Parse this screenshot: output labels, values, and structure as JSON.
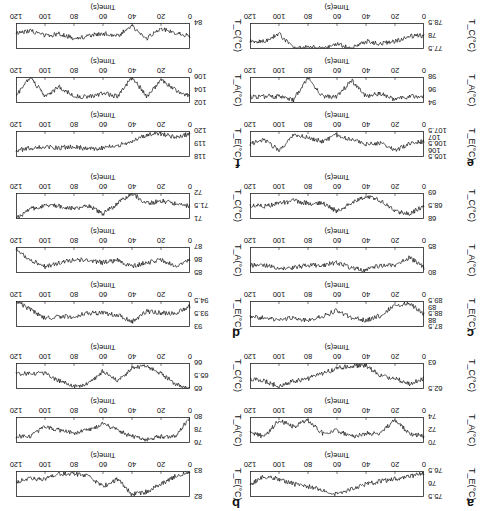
{
  "figure": {
    "rotation_deg": 180,
    "x_axis": {
      "label": "Time(s)",
      "ticks": [
        "0",
        "20",
        "40",
        "60",
        "80",
        "100",
        "120"
      ],
      "range": [
        0,
        120
      ]
    },
    "panels": [
      {
        "label": "a",
        "TE": {
          "ylabel": "T_E(°C)",
          "ticks": [
            "75.5",
            "76",
            "76.5"
          ],
          "range": [
            75.5,
            76.5
          ]
        },
        "TA": {
          "ylabel": "T_A(°C)",
          "ticks": [
            "70",
            "72",
            "74"
          ],
          "range": [
            70,
            74
          ]
        },
        "TC": {
          "ylabel": "T_C(°C)",
          "ticks": [
            "62.5",
            "63"
          ],
          "range": [
            62.5,
            63
          ]
        }
      },
      {
        "label": "b",
        "TE": {
          "ylabel": "T_E(°C)",
          "ticks": [
            "82",
            "83"
          ],
          "range": [
            82,
            83
          ]
        },
        "TA": {
          "ylabel": "T_A(°C)",
          "ticks": [
            "76",
            "78",
            "80"
          ],
          "range": [
            76,
            80
          ]
        },
        "TC": {
          "ylabel": "T_C(°C)",
          "ticks": [
            "65",
            "65.5",
            "66"
          ],
          "range": [
            65,
            66
          ]
        }
      },
      {
        "label": "c",
        "TE": {
          "ylabel": "T_E(°C)",
          "ticks": [
            "87.5",
            "88",
            "88.5",
            "89",
            "89.5"
          ],
          "range": [
            87.5,
            89.5
          ]
        },
        "TA": {
          "ylabel": "T_A(°C)",
          "ticks": [
            "80",
            "85"
          ],
          "range": [
            80,
            85
          ]
        },
        "TC": {
          "ylabel": "T_C(°C)",
          "ticks": [
            "68",
            "68.5",
            "69"
          ],
          "range": [
            68,
            69
          ]
        }
      },
      {
        "label": "d",
        "TE": {
          "ylabel": "T_E(°C)",
          "ticks": [
            "93",
            "93.5",
            "94.5"
          ],
          "range": [
            93,
            94.5
          ]
        },
        "TA": {
          "ylabel": "T_A(°C)",
          "ticks": [
            "85",
            "86",
            "87"
          ],
          "range": [
            85,
            87
          ]
        },
        "TC": {
          "ylabel": "T_C(°C)",
          "ticks": [
            "71",
            "71.5",
            "72"
          ],
          "range": [
            71,
            72
          ]
        }
      },
      {
        "label": "e",
        "TE": {
          "ylabel": "T_E(°C)",
          "ticks": [
            "105.5",
            "106",
            "106.5",
            "107",
            "107.5"
          ],
          "range": [
            105.5,
            107.5
          ]
        },
        "TA": {
          "ylabel": "T_A(°C)",
          "ticks": [
            "94",
            "96",
            "98"
          ],
          "range": [
            94,
            98
          ]
        },
        "TC": {
          "ylabel": "T_C(°C)",
          "ticks": [
            "77.5",
            "78",
            "78.5"
          ],
          "range": [
            77.5,
            78.5
          ]
        }
      },
      {
        "label": "f",
        "TE": {
          "ylabel": "T_E(°C)",
          "ticks": [
            "118",
            "119",
            "120"
          ],
          "range": [
            118,
            120
          ]
        },
        "TA": {
          "ylabel": "T_A(°C)",
          "ticks": [
            "102",
            "104",
            "106"
          ],
          "range": [
            102,
            106
          ]
        },
        "TC": {
          "ylabel": "T_C(°C)",
          "ticks": [
            "84"
          ],
          "range": [
            84,
            85
          ]
        }
      }
    ]
  },
  "chart_data": [
    {
      "type": "line",
      "panel": "a",
      "series": "T_E",
      "xlabel": "Time(s)",
      "ylabel": "T_E(°C)",
      "xlim": [
        0,
        120
      ],
      "ylim": [
        75.5,
        76.5
      ],
      "x": [
        0,
        10,
        20,
        30,
        40,
        50,
        60,
        70,
        80,
        90,
        100,
        110,
        120
      ],
      "values": [
        76.4,
        76.3,
        76.2,
        76.1,
        76.0,
        75.8,
        75.6,
        75.8,
        75.9,
        76.0,
        76.2,
        76.3,
        76.0
      ]
    },
    {
      "type": "line",
      "panel": "a",
      "series": "T_A",
      "xlabel": "Time(s)",
      "ylabel": "T_A(°C)",
      "xlim": [
        0,
        120
      ],
      "ylim": [
        70,
        74
      ],
      "x": [
        0,
        10,
        20,
        30,
        40,
        50,
        60,
        70,
        80,
        90,
        100,
        110,
        120
      ],
      "values": [
        71,
        71.5,
        73.5,
        71.5,
        71.5,
        71,
        72,
        71.5,
        73.5,
        72.5,
        73.5,
        71,
        71.5
      ]
    },
    {
      "type": "line",
      "panel": "a",
      "series": "T_C",
      "xlabel": "Time(s)",
      "ylabel": "T_C(°C)",
      "xlim": [
        0,
        120
      ],
      "ylim": [
        62.5,
        63
      ],
      "x": [
        0,
        10,
        20,
        30,
        40,
        50,
        60,
        70,
        80,
        90,
        100,
        110,
        120
      ],
      "values": [
        62.7,
        62.6,
        62.7,
        62.75,
        62.95,
        62.95,
        62.9,
        62.8,
        62.7,
        62.65,
        62.55,
        62.65,
        62.7
      ]
    },
    {
      "type": "line",
      "panel": "b",
      "series": "T_E",
      "xlabel": "Time(s)",
      "ylabel": "T_E(°C)",
      "xlim": [
        0,
        120
      ],
      "ylim": [
        82,
        83
      ],
      "x": [
        0,
        10,
        20,
        30,
        40,
        50,
        60,
        70,
        80,
        90,
        100,
        110,
        120
      ],
      "values": [
        83,
        82.8,
        82.5,
        82.2,
        82.1,
        82.7,
        82.4,
        82.8,
        82.9,
        82.9,
        82.7,
        82.7,
        82.6
      ]
    },
    {
      "type": "line",
      "panel": "b",
      "series": "T_A",
      "xlabel": "Time(s)",
      "ylabel": "T_A(°C)",
      "xlim": [
        0,
        120
      ],
      "ylim": [
        76,
        80
      ],
      "x": [
        0,
        10,
        20,
        30,
        40,
        50,
        60,
        70,
        80,
        90,
        100,
        110,
        120
      ],
      "values": [
        80,
        77,
        77,
        76.5,
        77,
        78,
        79,
        78,
        77.5,
        78,
        78.5,
        77,
        77
      ]
    },
    {
      "type": "line",
      "panel": "b",
      "series": "T_C",
      "xlabel": "Time(s)",
      "ylabel": "T_C(°C)",
      "xlim": [
        0,
        120
      ],
      "ylim": [
        65,
        66
      ],
      "x": [
        0,
        10,
        20,
        30,
        40,
        50,
        60,
        70,
        80,
        90,
        100,
        110,
        120
      ],
      "values": [
        65,
        65.2,
        65.6,
        65.9,
        65.8,
        65.3,
        65.7,
        65.2,
        65.1,
        65.3,
        65.6,
        65.6,
        65.6
      ]
    },
    {
      "type": "line",
      "panel": "c",
      "series": "T_E",
      "xlabel": "Time(s)",
      "ylabel": "T_E(°C)",
      "xlim": [
        0,
        120
      ],
      "ylim": [
        87.5,
        89.5
      ],
      "x": [
        0,
        10,
        20,
        30,
        40,
        50,
        60,
        70,
        80,
        90,
        100,
        110,
        120
      ],
      "values": [
        88.5,
        89.3,
        89.2,
        88.4,
        88,
        88.2,
        88.8,
        88.3,
        88,
        88.2,
        88.1,
        88.2,
        88.3
      ]
    },
    {
      "type": "line",
      "panel": "c",
      "series": "T_A",
      "xlabel": "Time(s)",
      "ylabel": "T_A(°C)",
      "xlim": [
        0,
        120
      ],
      "ylim": [
        80,
        85
      ],
      "x": [
        0,
        10,
        20,
        30,
        40,
        50,
        60,
        70,
        80,
        90,
        100,
        110,
        120
      ],
      "values": [
        81,
        83,
        81.5,
        81.5,
        80.5,
        81,
        82,
        81.5,
        81.5,
        81,
        81,
        81.5,
        81.5
      ]
    },
    {
      "type": "line",
      "panel": "c",
      "series": "T_C",
      "xlabel": "Time(s)",
      "ylabel": "T_C(°C)",
      "xlim": [
        0,
        120
      ],
      "ylim": [
        68,
        69
      ],
      "x": [
        0,
        10,
        20,
        30,
        40,
        50,
        60,
        70,
        80,
        90,
        100,
        110,
        120
      ],
      "values": [
        68.5,
        68.2,
        68.3,
        68.7,
        68.9,
        68.6,
        68.3,
        68.6,
        68.6,
        68.7,
        68.6,
        68.5,
        68.5
      ]
    },
    {
      "type": "line",
      "panel": "d",
      "series": "T_E",
      "xlabel": "Time(s)",
      "ylabel": "T_E(°C)",
      "xlim": [
        0,
        120
      ],
      "ylim": [
        93,
        94.5
      ],
      "x": [
        0,
        10,
        20,
        30,
        40,
        50,
        60,
        70,
        80,
        90,
        100,
        110,
        120
      ],
      "values": [
        94.2,
        93.8,
        93.8,
        93.9,
        93.3,
        93.7,
        93.8,
        93.8,
        93.6,
        93.6,
        93.5,
        94,
        94.5
      ]
    },
    {
      "type": "line",
      "panel": "d",
      "series": "T_A",
      "xlabel": "Time(s)",
      "ylabel": "T_A(°C)",
      "xlim": [
        0,
        120
      ],
      "ylim": [
        85,
        87
      ],
      "x": [
        0,
        10,
        20,
        30,
        40,
        50,
        60,
        70,
        80,
        90,
        100,
        110,
        120
      ],
      "values": [
        86,
        85.5,
        86,
        85.8,
        85.5,
        86,
        85.8,
        86,
        86,
        85.8,
        85.5,
        86,
        86.8
      ]
    },
    {
      "type": "line",
      "panel": "d",
      "series": "T_C",
      "xlabel": "Time(s)",
      "ylabel": "T_C(°C)",
      "xlim": [
        0,
        120
      ],
      "ylim": [
        71,
        72
      ],
      "x": [
        0,
        10,
        20,
        30,
        40,
        50,
        60,
        70,
        80,
        90,
        100,
        110,
        120
      ],
      "values": [
        71.5,
        71.6,
        71.7,
        71.6,
        72,
        71.6,
        71.2,
        71.5,
        71.4,
        71.5,
        71.5,
        71.4,
        71
      ]
    },
    {
      "type": "line",
      "panel": "e",
      "series": "T_E",
      "xlabel": "Time(s)",
      "ylabel": "T_E(°C)",
      "xlim": [
        0,
        120
      ],
      "ylim": [
        105.5,
        107.5
      ],
      "x": [
        0,
        10,
        20,
        30,
        40,
        50,
        60,
        70,
        80,
        90,
        100,
        110,
        120
      ],
      "values": [
        106.7,
        106.5,
        106,
        106.6,
        106.5,
        106.8,
        107.2,
        106.7,
        107,
        107.2,
        106,
        106.8,
        106.5
      ]
    },
    {
      "type": "line",
      "panel": "e",
      "series": "T_A",
      "xlabel": "Time(s)",
      "ylabel": "T_A(°C)",
      "xlim": [
        0,
        120
      ],
      "ylim": [
        94,
        98
      ],
      "x": [
        0,
        10,
        20,
        30,
        40,
        50,
        60,
        70,
        80,
        90,
        100,
        110,
        120
      ],
      "values": [
        95,
        95,
        94.5,
        95.5,
        95,
        97.5,
        95,
        95,
        98,
        94.5,
        95,
        95,
        95
      ]
    },
    {
      "type": "line",
      "panel": "e",
      "series": "T_C",
      "xlabel": "Time(s)",
      "ylabel": "T_C(°C)",
      "xlim": [
        0,
        120
      ],
      "ylim": [
        77.5,
        78.5
      ],
      "x": [
        0,
        10,
        20,
        30,
        40,
        50,
        60,
        70,
        80,
        90,
        100,
        110,
        120
      ],
      "values": [
        78,
        78,
        77.8,
        77.7,
        77.8,
        77.5,
        77.7,
        77.5,
        77.6,
        77.5,
        78.1,
        77.8,
        77.8
      ]
    },
    {
      "type": "line",
      "panel": "f",
      "series": "T_E",
      "xlabel": "Time(s)",
      "ylabel": "T_E(°C)",
      "xlim": [
        0,
        120
      ],
      "ylim": [
        118,
        120
      ],
      "x": [
        0,
        10,
        20,
        30,
        40,
        50,
        60,
        70,
        80,
        90,
        100,
        110,
        120
      ],
      "values": [
        119.8,
        119.5,
        119.8,
        119.7,
        119.2,
        118.9,
        118.7,
        118.6,
        118.8,
        118.7,
        118.8,
        118.7,
        118.5
      ]
    },
    {
      "type": "line",
      "panel": "f",
      "series": "T_A",
      "xlabel": "Time(s)",
      "ylabel": "T_A(°C)",
      "xlim": [
        0,
        120
      ],
      "ylim": [
        102,
        106
      ],
      "x": [
        0,
        10,
        20,
        30,
        40,
        50,
        60,
        70,
        80,
        90,
        100,
        110,
        120
      ],
      "values": [
        103,
        104,
        105.5,
        103,
        106,
        103,
        103.5,
        103,
        103,
        104.5,
        103,
        106,
        103
      ]
    },
    {
      "type": "line",
      "panel": "f",
      "series": "T_C",
      "xlabel": "Time(s)",
      "ylabel": "T_C(°C)",
      "xlim": [
        0,
        120
      ],
      "ylim": [
        84,
        85
      ],
      "x": [
        0,
        10,
        20,
        30,
        40,
        50,
        60,
        70,
        80,
        90,
        100,
        110,
        120
      ],
      "values": [
        84.5,
        84.6,
        84.8,
        84.4,
        84.9,
        84.5,
        84.6,
        84.5,
        84.4,
        84.6,
        84.5,
        84.7,
        84.6
      ]
    }
  ]
}
